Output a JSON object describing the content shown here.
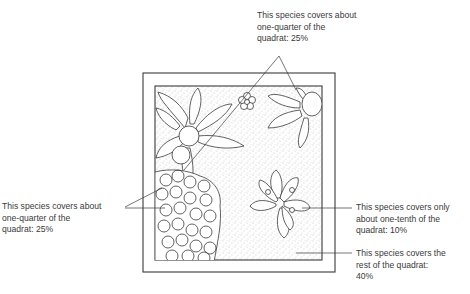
{
  "figure": {
    "type": "quadrat-diagram"
  },
  "labels": {
    "top": {
      "line1": "This species covers about",
      "line2": "one-quarter of the",
      "line3": "quadrat: 25%"
    },
    "left": {
      "line1": "This species covers about",
      "line2": "one-quarter of the",
      "line3": "quadrat: 25%"
    },
    "right_upper": {
      "line1": "This species covers only",
      "line2": "about one-tenth of the",
      "line3": "quadrat: 10%"
    },
    "right_lower": {
      "line1": "This species covers the",
      "line2": "rest of the quadrat:",
      "line3": "40%"
    }
  },
  "species_cover": [
    {
      "region": "top (leafy rosette plants)",
      "percent": 25
    },
    {
      "region": "bottom-left (clustered flowers)",
      "percent": 25
    },
    {
      "region": "centre-right (large flower)",
      "percent": 10
    },
    {
      "region": "stippled background",
      "percent": 40
    }
  ],
  "colors": {
    "line": "#3a3a3a",
    "stipple": "#9a9a9a",
    "background": "#ffffff"
  }
}
